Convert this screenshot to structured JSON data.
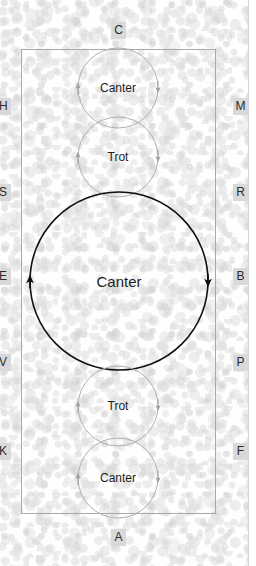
{
  "diagram": {
    "arena": {
      "border_color": "#a9a9a9",
      "background": "#fefefe"
    },
    "markers": {
      "top": [
        {
          "name": "marker-c",
          "label": "C",
          "x": 111,
          "y": 22
        }
      ],
      "bottom": [
        {
          "name": "marker-a",
          "label": "A",
          "x": 111,
          "y": 529
        }
      ],
      "left": [
        {
          "name": "marker-h",
          "label": "H",
          "x": -3,
          "y": 98
        },
        {
          "name": "marker-s",
          "label": "S",
          "x": -3,
          "y": 184
        },
        {
          "name": "marker-e",
          "label": "E",
          "x": -3,
          "y": 268
        },
        {
          "name": "marker-v",
          "label": "V",
          "x": -3,
          "y": 354
        },
        {
          "name": "marker-k",
          "label": "K",
          "x": -3,
          "y": 443
        }
      ],
      "right": [
        {
          "name": "marker-m",
          "label": "M",
          "x": 233,
          "y": 98
        },
        {
          "name": "marker-r",
          "label": "R",
          "x": 233,
          "y": 184
        },
        {
          "name": "marker-b",
          "label": "B",
          "x": 233,
          "y": 268
        },
        {
          "name": "marker-p",
          "label": "P",
          "x": 233,
          "y": 354
        },
        {
          "name": "marker-f",
          "label": "F",
          "x": 233,
          "y": 443
        }
      ]
    },
    "figures": [
      {
        "name": "circle-canter-top",
        "label": "Canter",
        "cx": 118,
        "cy": 88,
        "r": 40,
        "stroke": "#b0b0b0",
        "stroke_width": 1,
        "size": "small",
        "direction": "clockwise"
      },
      {
        "name": "circle-trot-upper",
        "label": "Trot",
        "cx": 118,
        "cy": 157,
        "r": 40,
        "stroke": "#b0b0b0",
        "stroke_width": 1,
        "size": "small",
        "direction": "clockwise"
      },
      {
        "name": "circle-canter-center",
        "label": "Canter",
        "cx": 119,
        "cy": 281,
        "r": 89,
        "stroke": "#101010",
        "stroke_width": 1.6,
        "size": "large",
        "direction": "clockwise"
      },
      {
        "name": "circle-trot-lower",
        "label": "Trot",
        "cx": 118,
        "cy": 406,
        "r": 40,
        "stroke": "#b0b0b0",
        "stroke_width": 1,
        "size": "small",
        "direction": "clockwise"
      },
      {
        "name": "circle-canter-bottom",
        "label": "Canter",
        "cx": 118,
        "cy": 478,
        "r": 40,
        "stroke": "#b0b0b0",
        "stroke_width": 1,
        "size": "small",
        "direction": "clockwise"
      }
    ]
  }
}
